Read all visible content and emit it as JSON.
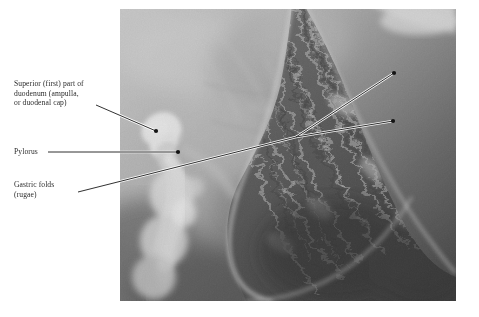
{
  "figure": {
    "type": "radiograph",
    "modality": "double-contrast barium X-ray",
    "region": "stomach and duodenum",
    "plate": {
      "left": 120,
      "top": 9,
      "width": 336,
      "height": 292,
      "background_color": "#6d6d6d",
      "page_background": "#ffffff"
    }
  },
  "labels": [
    {
      "id": "duodenum",
      "text": "Superior (first) part of\nduodenum (ampulla,\nor duodenal cap)",
      "color": "#2b2b2b",
      "leader": {
        "from_x": 96,
        "from_y": 105,
        "to_x": 156,
        "to_y": 131
      },
      "marker": {
        "x": 156,
        "y": 131,
        "color": "#141414"
      }
    },
    {
      "id": "pylorus",
      "text": "Pylorus",
      "color": "#2b2b2b",
      "leader": {
        "from_x": 48,
        "from_y": 152,
        "to_x": 178,
        "to_y": 152
      },
      "marker": {
        "x": 178,
        "y": 152,
        "color": "#141414"
      }
    },
    {
      "id": "rugae",
      "text": "Gastric folds\n(rugae)",
      "color": "#2b2b2b",
      "leader": {
        "from_x": 78,
        "from_y": 192,
        "to_x": 296,
        "to_y": 137
      },
      "branches": [
        {
          "to_x": 394,
          "to_y": 73
        },
        {
          "to_x": 393,
          "to_y": 121
        }
      ],
      "markers": [
        {
          "x": 394,
          "y": 73,
          "color": "#141414"
        },
        {
          "x": 393,
          "y": 121,
          "color": "#141414"
        }
      ]
    }
  ],
  "leader_style": {
    "stroke": "#1a1a1a",
    "highlight": "#ffffff",
    "width": 0.9
  },
  "radiograph_tones": {
    "upper_left_soft_tissue": "#c9c9c9",
    "mid_gray": "#9a9a9a",
    "stomach_dark": "#4a4a4a",
    "stomach_darkest": "#2a2a2a",
    "barium_bright": "#f2f2f2",
    "rugae_highlight": "#d8d8d8"
  }
}
